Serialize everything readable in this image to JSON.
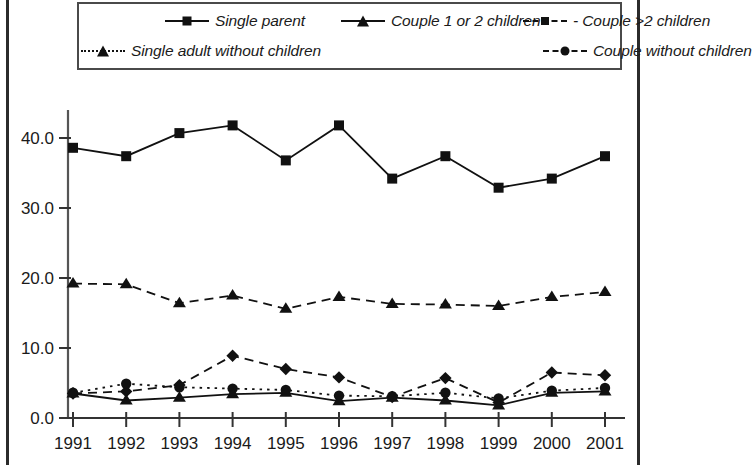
{
  "figure": {
    "background": "#ffffff",
    "frame_color": "#2b2b2b"
  },
  "legend": {
    "position": "top",
    "border_color": "#4a4a4a",
    "rows": [
      [
        {
          "label": "Single parent",
          "marker": "square",
          "line": "solid",
          "key_name": "legend-key-single-parent"
        },
        {
          "label": "Couple 1 or 2 children",
          "marker": "triangle",
          "line": "solid",
          "key_name": "legend-key-couple-1-or-2-children"
        },
        {
          "label": "- Couple >2 children",
          "marker": "diamond",
          "line": "dashed",
          "key_name": "legend-key-couple-more-than-2-children"
        }
      ],
      [
        {
          "label": "Single adult without children",
          "marker": "triangle",
          "line": "dotted",
          "key_name": "legend-key-single-adult-without-children"
        },
        {
          "label": "Couple without children",
          "marker": "circle",
          "line": "dashed",
          "key_name": "legend-key-couple-without-children"
        }
      ]
    ]
  },
  "chart_data": {
    "type": "line",
    "title": "",
    "xlabel": "",
    "ylabel": "",
    "x": [
      "1991",
      "1992",
      "1993",
      "1994",
      "1995",
      "1996",
      "1997",
      "1998",
      "1999",
      "2000",
      "2001"
    ],
    "xlim": [
      1991,
      2001
    ],
    "ylim": [
      0.0,
      44.0
    ],
    "yticks": [
      0.0,
      10.0,
      20.0,
      30.0,
      40.0
    ],
    "ytick_labels": [
      "0.0",
      "10.0",
      "20.0",
      "30.0",
      "40.0"
    ],
    "grid": false,
    "legend_position": "above-plot",
    "series": [
      {
        "name": "Single parent",
        "marker": "square",
        "line": "solid",
        "color": "#111111",
        "values": [
          38.6,
          37.4,
          40.7,
          41.8,
          36.8,
          41.8,
          34.2,
          37.4,
          32.9,
          34.2,
          37.4
        ]
      },
      {
        "name": "Single adult without children",
        "marker": "triangle",
        "line": "dashed",
        "color": "#111111",
        "values": [
          19.2,
          19.1,
          16.4,
          17.5,
          15.6,
          17.3,
          16.3,
          16.2,
          16.0,
          17.3,
          18.0
        ]
      },
      {
        "name": "Couple >2 children",
        "marker": "diamond",
        "line": "dashed",
        "color": "#111111",
        "values": [
          3.5,
          3.8,
          4.7,
          8.9,
          7.0,
          5.8,
          3.0,
          5.7,
          2.2,
          6.5,
          6.1
        ]
      },
      {
        "name": "Couple without children",
        "marker": "circle",
        "line": "dotted",
        "color": "#111111",
        "values": [
          3.6,
          4.9,
          4.4,
          4.2,
          4.0,
          3.2,
          3.1,
          3.6,
          2.8,
          3.9,
          4.3
        ]
      },
      {
        "name": "Couple 1 or 2 children",
        "marker": "triangle",
        "line": "solid",
        "color": "#111111",
        "values": [
          3.5,
          2.5,
          2.9,
          3.4,
          3.6,
          2.4,
          2.9,
          2.5,
          1.8,
          3.6,
          3.8
        ]
      }
    ]
  }
}
